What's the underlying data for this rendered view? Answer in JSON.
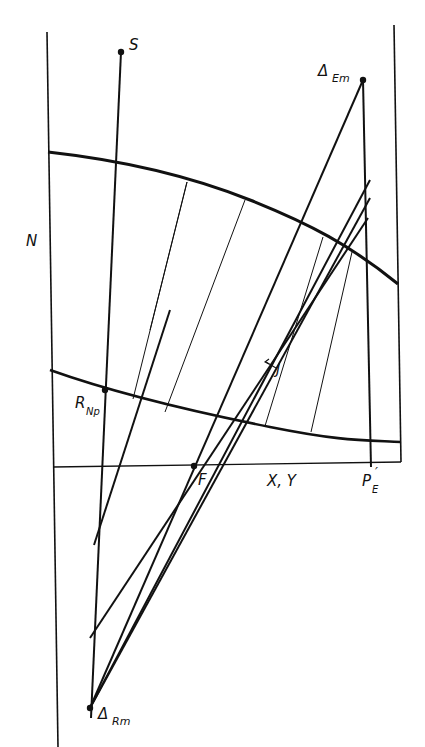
{
  "figure": {
    "type": "ponchon-savarit-style extraction diagram",
    "colors": {
      "ink": "#111111",
      "background": "#ffffff"
    }
  },
  "labels": {
    "S": "S",
    "N": "N",
    "delta_em_main": "Δ",
    "delta_em_sub": "Em",
    "r_np_main": "R",
    "r_np_sub": "Np",
    "j": "J",
    "f": "F",
    "xy": "X, Y",
    "pe_main": "P",
    "pe_prime": "′",
    "pe_sub": "E",
    "delta_rm_main": "Δ",
    "delta_rm_sub": "Rm"
  },
  "points": {
    "S": [
      121,
      52
    ],
    "delta_Em": [
      363,
      80
    ],
    "R_Np": [
      105,
      390
    ],
    "F": [
      194,
      466
    ],
    "P_E_prime": [
      371,
      467
    ],
    "delta_Rm": [
      90,
      708
    ]
  },
  "curves": {
    "extract_curve": [
      [
        48,
        152
      ],
      [
        115,
        163
      ],
      [
        180,
        180
      ],
      [
        245,
        200
      ],
      [
        310,
        230
      ],
      [
        360,
        256
      ],
      [
        398,
        284
      ]
    ],
    "raffinate_curve": [
      [
        50,
        370
      ],
      [
        105,
        390
      ],
      [
        180,
        408
      ],
      [
        260,
        426
      ],
      [
        320,
        433
      ],
      [
        372,
        440
      ],
      [
        401,
        442
      ]
    ]
  },
  "tie_lines": [
    [
      [
        187,
        182
      ],
      [
        133,
        399
      ]
    ],
    [
      [
        245,
        200
      ],
      [
        165,
        412
      ]
    ],
    [
      [
        323,
        237
      ],
      [
        265,
        426
      ]
    ],
    [
      [
        352,
        252
      ],
      [
        311,
        432
      ]
    ]
  ]
}
